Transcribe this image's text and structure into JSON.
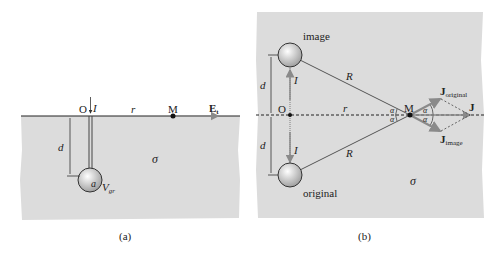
{
  "panel_a": {
    "caption": "(a)",
    "labels": {
      "origin": "O",
      "current": "I",
      "distance_r": "r",
      "point": "M",
      "field": "E",
      "field_sub": "t",
      "depth": "d",
      "radius": "a",
      "voltage": "V",
      "voltage_sub": "gr",
      "conductivity": "σ"
    }
  },
  "panel_b": {
    "caption": "(b)",
    "labels": {
      "image_sphere": "image",
      "original_sphere": "original",
      "origin": "O",
      "current_top": "I",
      "current_bottom": "I",
      "depth_top": "d",
      "depth_bottom": "d",
      "distance_R_top": "R",
      "distance_R_bottom": "R",
      "distance_r": "r",
      "point": "M",
      "angle": "α",
      "J_original": "J",
      "J_original_sub": "original",
      "J_image": "J",
      "J_image_sub": "image",
      "J_total": "J",
      "conductivity": "σ"
    }
  },
  "colors": {
    "ground": "#dcdcdc",
    "line": "#333333",
    "vector": "#8a8a8a"
  }
}
